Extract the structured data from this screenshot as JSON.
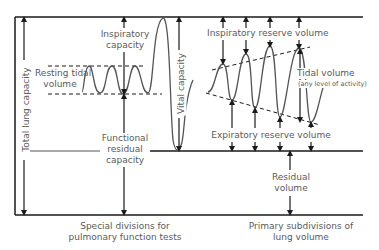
{
  "diagram": {
    "labels": {
      "total_lung_capacity": "Total lung capacity",
      "inspiratory_capacity_1": "Inspiratory",
      "inspiratory_capacity_2": "capacity",
      "resting_tidal_1": "Resting tidal",
      "resting_tidal_2": "volume",
      "vital_capacity": "Vital capacity",
      "frc_1": "Functional",
      "frc_2": "residual",
      "frc_3": "capacity",
      "irv": "Inspiratory reserve volume",
      "tidal_volume": "Tidal volume",
      "tidal_volume_note": "(any level of activity)",
      "erv": "Expiratory reserve volume",
      "residual_1": "Residual",
      "residual_2": "volume",
      "caption_left_1": "Special divisions for",
      "caption_left_2": "pulmonary function tests",
      "caption_right_1": "Primary subdivisions of",
      "caption_right_2": "lung volume"
    },
    "colors": {
      "line": "#1a1a1a",
      "curve": "#555555",
      "text": "#5a5a5a"
    }
  }
}
